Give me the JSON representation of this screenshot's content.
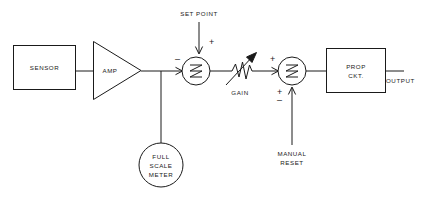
{
  "diagram": {
    "blocks": [
      {
        "id": "sensor",
        "label": "SENSOR",
        "shape": "rect",
        "x": 13,
        "y": 45,
        "w": 62,
        "h": 44
      },
      {
        "id": "amp",
        "label": "AMP",
        "shape": "triangle",
        "x": 93,
        "y": 40,
        "w": 48,
        "h": 56
      },
      {
        "id": "meter",
        "label_line1": "FULL",
        "label_line2": "SCALE",
        "label_line3": "METER",
        "shape": "circle",
        "cx": 161,
        "cy": 165,
        "r": 22
      },
      {
        "id": "sum1",
        "label": "summation-1",
        "shape": "circle",
        "cx": 196,
        "cy": 71,
        "r": 14
      },
      {
        "id": "gain",
        "label": "GAIN",
        "shape": "variable-resistor",
        "cx": 243,
        "cy": 71
      },
      {
        "id": "sum2",
        "label": "summation-2",
        "shape": "circle",
        "cx": 292,
        "cy": 71,
        "r": 14
      },
      {
        "id": "propckt",
        "label_line1": "PROP",
        "label_line2": "CKT.",
        "shape": "rect",
        "x": 326,
        "y": 48,
        "w": 59,
        "h": 44
      }
    ],
    "labels": {
      "sensor": "SENSOR",
      "amp": "AMP",
      "set_point": "SET POINT",
      "gain": "GAIN",
      "manual_reset_line1": "MANUAL",
      "manual_reset_line2": "RESET",
      "meter_line1": "FULL",
      "meter_line2": "SCALE",
      "meter_line3": "METER",
      "prop_line1": "PROP",
      "prop_line2": "CKT.",
      "output": "OUTPUT"
    },
    "signs": {
      "sum1_setpoint": "+",
      "sum1_feedback": "–",
      "sum2_gain_in": "+",
      "sum2_reset_plus": "+",
      "sum2_reset_minus": "–"
    },
    "colors": {
      "line": "#1a1a1a",
      "text": "#1a1a1a",
      "background": "#ffffff"
    }
  }
}
